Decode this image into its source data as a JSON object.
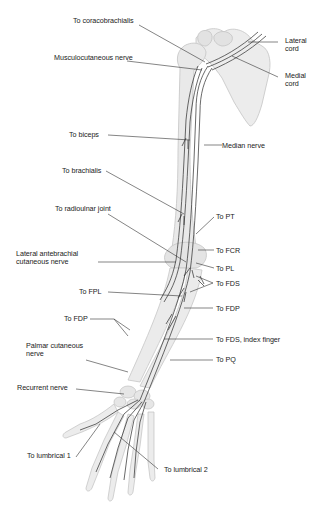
{
  "figure": {
    "colors": {
      "background": "#ffffff",
      "bone": "#e6e6e6",
      "bone_outline": "#bdbdbd",
      "nerve": "#2a2a2a",
      "leader_line": "#333333",
      "text": "#222222"
    },
    "labels": {
      "to_coracobrachialis": "To coracobrachialis",
      "musculocutaneous_nerve": "Musculocutaneous nerve",
      "lateral_cord_1": "Lateral",
      "lateral_cord_2": "cord",
      "medial_cord_1": "Medial",
      "medial_cord_2": "cord",
      "to_biceps": "To biceps",
      "median_nerve": "Median nerve",
      "to_brachialis": "To brachialis",
      "to_radioulnar_joint": "To radioulnar joint",
      "to_pt": "To PT",
      "to_fcr": "To FCR",
      "lateral_antebrachial_1": "Lateral antebrachial",
      "lateral_antebrachial_2": "cutaneous nerve",
      "to_pl": "To PL",
      "to_fds": "To FDS",
      "to_fpl": "To FPL",
      "to_fdp_right": "To FDP",
      "to_fdp_left": "To FDP",
      "to_fds_index": "To FDS, index finger",
      "palmar_cutaneous_1": "Palmar cutaneous",
      "palmar_cutaneous_2": "nerve",
      "to_pq": "To PQ",
      "recurrent_nerve": "Recurrent nerve",
      "to_lumbrical_1": "To lumbrical 1",
      "to_lumbrical_2": "To lumbrical 2"
    }
  }
}
